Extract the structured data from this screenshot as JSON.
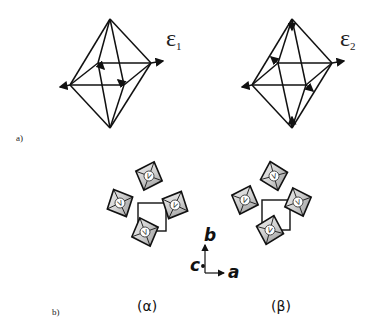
{
  "figure": {
    "panel_a": {
      "label": "a)",
      "modes": [
        {
          "symbol": "ε",
          "subscript": "1"
        },
        {
          "symbol": "ε",
          "subscript": "2"
        }
      ]
    },
    "panel_b": {
      "label": "b)",
      "vertex_label": "V",
      "phases": [
        {
          "label": "(α)"
        },
        {
          "label": "(β)"
        }
      ],
      "axes": {
        "a": "a",
        "b": "b",
        "c": "c"
      }
    }
  }
}
